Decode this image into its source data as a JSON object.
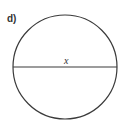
{
  "diagram": {
    "part_label": "d)",
    "diameter_label": "x",
    "stroke_color": "#3a3a3a",
    "circle": {
      "cx": 65,
      "cy": 67,
      "r": 52
    }
  }
}
